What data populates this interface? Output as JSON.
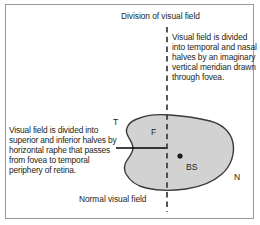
{
  "figure": {
    "title_top": "Division of visual field",
    "caption_bottom": "Normal visual field",
    "text_right": "Visual field is divided into temporal and nasal halves by an imaginary vertical meridian drawn through fovea.",
    "text_left": "Visual field is divided into superior and inferior halves by horizontal raphe that passes from fovea to temporal periphery of retina.",
    "labels": {
      "temporal": "T",
      "nasal": "N",
      "fovea": "F",
      "blind_spot": "BS"
    },
    "colors": {
      "field_fill": "#d2d2d2",
      "field_stroke": "#3a3a3a",
      "divider_line": "#3a3a3a",
      "raphe_line": "#000000",
      "text": "#231f20",
      "frame_border": "#9a9a9a",
      "background": "#ffffff"
    }
  }
}
